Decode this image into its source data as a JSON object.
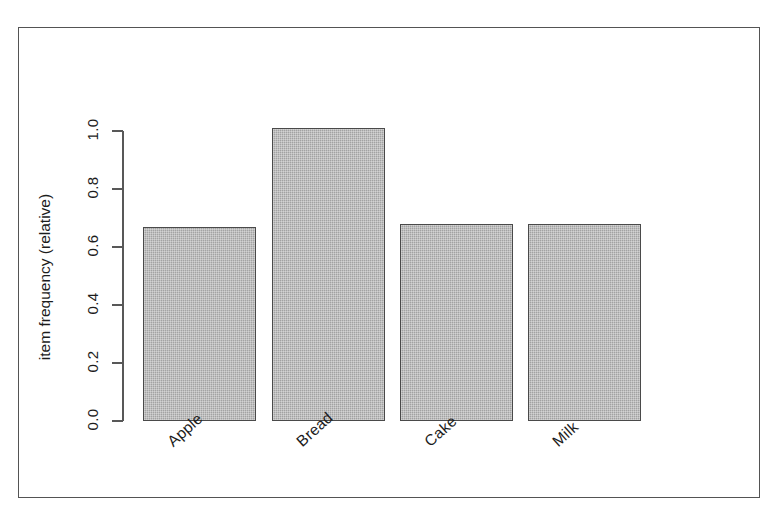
{
  "chart_data": {
    "type": "bar",
    "title": "",
    "subtitle": "",
    "xlabel": "",
    "ylabel": "item frequency (relative)",
    "categories": [
      "Apple",
      "Bread",
      "Cake",
      "Milk"
    ],
    "values": [
      0.67,
      1.01,
      0.68,
      0.68
    ],
    "series": [
      {
        "name": "item frequency (relative)",
        "values": [
          0.67,
          1.01,
          0.68,
          0.68
        ]
      }
    ],
    "ylim": [
      0.0,
      1.05
    ],
    "y_ticks": [
      0.0,
      0.2,
      0.4,
      0.6,
      0.8,
      1.0
    ],
    "y_tick_labels": [
      "0.0",
      "0.2",
      "0.4",
      "0.6",
      "0.8",
      "1.0"
    ],
    "grid": false,
    "legend": null,
    "legend_position": "none",
    "annotations": [],
    "colors": {
      "bar_fill": "#a9a9a9",
      "bar_border": "#4a4a4a",
      "axis": "#585858",
      "frame": "#545454",
      "text": "#1c1c1c",
      "background": "#ffffff"
    },
    "x_tick_label_rotation": -42,
    "y_tick_label_rotation": -90
  },
  "figure": {
    "frame_border_visible": true,
    "background": "#ffffff"
  }
}
